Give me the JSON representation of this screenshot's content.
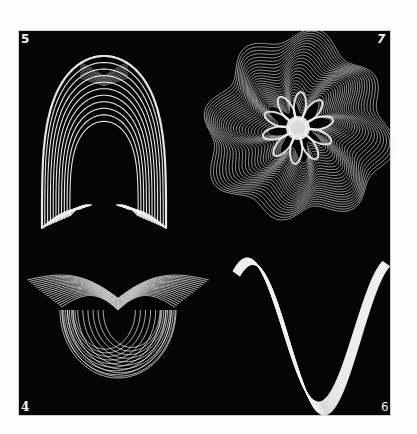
{
  "plate": {
    "background": "#050505",
    "line_color": "#f2f2f2",
    "figures": [
      {
        "id": "fig-5",
        "label": "5",
        "position": "top-left",
        "shape": "arch-with-curled-ends"
      },
      {
        "id": "fig-7",
        "label": "7",
        "position": "top-right",
        "shape": "rosette"
      },
      {
        "id": "fig-4",
        "label": "4",
        "position": "bottom-left",
        "shape": "winged-bowl"
      },
      {
        "id": "fig-6",
        "label": "6",
        "position": "bottom-right",
        "shape": "n-curve-ribbon"
      }
    ]
  }
}
